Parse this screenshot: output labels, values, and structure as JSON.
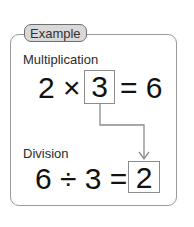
{
  "badge": {
    "label": "Example"
  },
  "multiplication": {
    "label": "Multiplication",
    "left": "2 ×",
    "boxed": "3",
    "right": "= 6"
  },
  "division": {
    "label": "Division",
    "left": "6 ÷ 3 =",
    "boxed": "2"
  },
  "colors": {
    "border": "#9a9a9a",
    "badge_fill": "#d9d9d9",
    "arrow": "#8c8c8c"
  }
}
